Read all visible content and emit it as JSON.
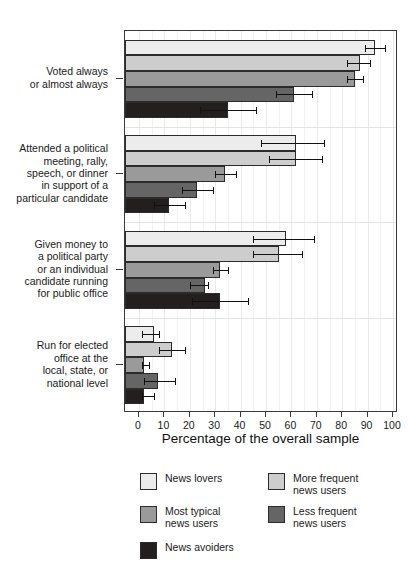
{
  "chart_data": {
    "type": "bar",
    "orientation": "horizontal",
    "title": "",
    "xlabel": "Percentage of the overall sample",
    "ylabel": "",
    "xlim": [
      0,
      105
    ],
    "xticks": [
      0,
      10,
      20,
      30,
      40,
      50,
      60,
      70,
      80,
      90,
      100
    ],
    "grid": true,
    "legend_position": "bottom",
    "categories": [
      "Voted always\nor almost always",
      "Attended a political\nmeeting, rally,\nspeech, or dinner\nin support of a\nparticular candidate",
      "Given money to\na political party\nor an individual\ncandidate running\nfor public office",
      "Run for elected\noffice at the\nlocal, state, or\nnational level"
    ],
    "series": [
      {
        "name": "News lovers",
        "color": "#ececec",
        "values": [
          93,
          62,
          58,
          6
        ],
        "err_low": [
          89,
          48,
          45,
          1
        ],
        "err_high": [
          97,
          73,
          69,
          8
        ]
      },
      {
        "name": "More frequent\nnews users",
        "color": "#cdcdcd",
        "values": [
          87,
          62,
          55,
          13
        ],
        "err_low": [
          82,
          51,
          45,
          8
        ],
        "err_high": [
          91,
          72,
          64,
          18
        ]
      },
      {
        "name": "Most typical\nnews users",
        "color": "#9a9a9a",
        "values": [
          85,
          34,
          32,
          2
        ],
        "err_low": [
          82,
          30,
          29,
          1
        ],
        "err_high": [
          88,
          38,
          35,
          4
        ]
      },
      {
        "name": "Less frequent\nnews users",
        "color": "#656565",
        "values": [
          61,
          23,
          26,
          7.5
        ],
        "err_low": [
          54,
          17,
          20,
          2
        ],
        "err_high": [
          68,
          29,
          27,
          14
        ]
      },
      {
        "name": "News avoiders",
        "color": "#231f1f",
        "values": [
          35,
          12,
          32,
          2
        ],
        "err_low": [
          24,
          6,
          21,
          1
        ],
        "err_high": [
          46,
          18,
          43,
          6
        ]
      }
    ]
  },
  "legend": {
    "items": [
      {
        "label": "News lovers",
        "color": "#ececec"
      },
      {
        "label": "More frequent\nnews users",
        "color": "#cdcdcd"
      },
      {
        "label": "Most typical\nnews users",
        "color": "#9a9a9a"
      },
      {
        "label": "Less frequent\nnews users",
        "color": "#656565"
      },
      {
        "label": "News avoiders",
        "color": "#231f1f"
      }
    ]
  }
}
